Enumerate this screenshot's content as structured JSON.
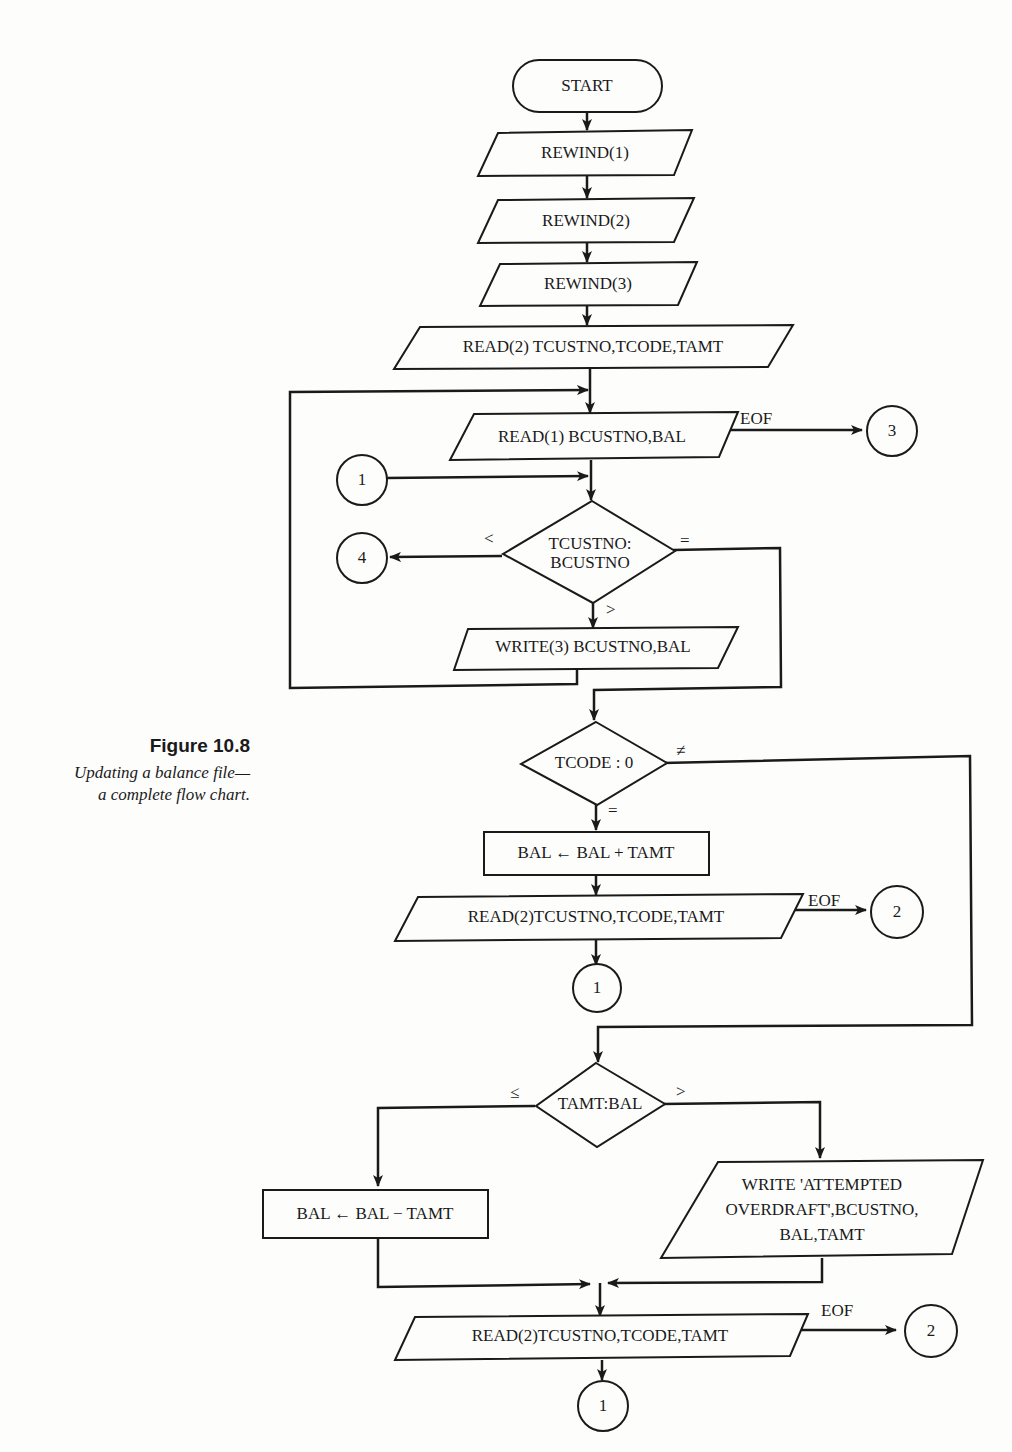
{
  "caption": {
    "title": "Figure 10.8",
    "line1": "Updating a balance file—",
    "line2": "a complete flow chart."
  },
  "nodes": {
    "start": "START",
    "rewind1": "REWIND(1)",
    "rewind2": "REWIND(2)",
    "rewind3": "REWIND(3)",
    "read_trans_init": "READ(2) TCUSTNO,TCODE,TAMT",
    "read_balance": "READ(1) BCUSTNO,BAL",
    "compare_custno_line1": "TCUSTNO:",
    "compare_custno_line2": "BCUSTNO",
    "write_balance": "WRITE(3) BCUSTNO,BAL",
    "compare_tcode": "TCODE : 0",
    "add_amount": "BAL ← BAL + TAMT",
    "read_trans_after_add": "READ(2)TCUSTNO,TCODE,TAMT",
    "compare_amt": "TAMT:BAL",
    "subtract_amount": "BAL ← BAL − TAMT",
    "write_overdraft_line1": "WRITE 'ATTEMPTED",
    "write_overdraft_line2": "OVERDRAFT',BCUSTNO,",
    "write_overdraft_line3": "BAL,TAMT",
    "read_trans_final": "READ(2)TCUSTNO,TCODE,TAMT"
  },
  "connectors": {
    "c3_eof_balance": "3",
    "c1_entry": "1",
    "c4_less": "4",
    "c2_eof_after_add": "2",
    "c1_after_add": "1",
    "c2_eof_final": "2",
    "c1_final": "1"
  },
  "edge_labels": {
    "eof_balance": "EOF",
    "less": "<",
    "equal": "=",
    "greater": ">",
    "not_equal": "≠",
    "tcode_equal": "=",
    "eof_after_add": "EOF",
    "le": "≤",
    "gt": ">",
    "eof_final": "EOF"
  }
}
